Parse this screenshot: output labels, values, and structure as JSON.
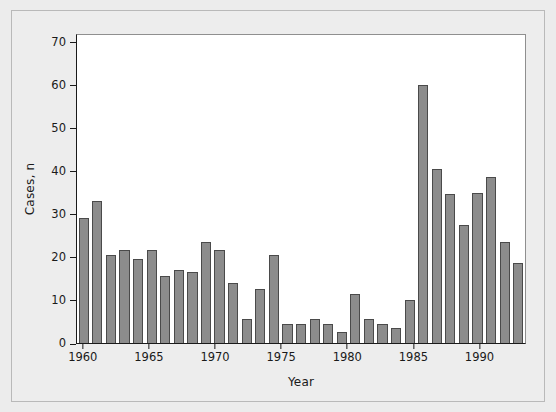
{
  "chart_data": {
    "type": "bar",
    "title": "",
    "xlabel": "Year",
    "ylabel": "Cases, n",
    "xlim": [
      1960,
      1993
    ],
    "ylim": [
      0,
      72
    ],
    "grid": false,
    "legend": null,
    "y_ticks": [
      0,
      10,
      20,
      30,
      40,
      50,
      60,
      70
    ],
    "x_ticks": [
      1960,
      1965,
      1970,
      1975,
      1980,
      1985,
      1990
    ],
    "categories": [
      1961,
      1962,
      1963,
      1964,
      1965,
      1966,
      1967,
      1968,
      1969,
      1970,
      1971,
      1972,
      1973,
      1974,
      1975,
      1976,
      1977,
      1978,
      1979,
      1980,
      1981,
      1982,
      1983,
      1984,
      1985,
      1986,
      1987,
      1988,
      1989,
      1990,
      1991,
      1992,
      1993
    ],
    "values": [
      29,
      33,
      20.5,
      21.5,
      19.5,
      21.5,
      15.5,
      17,
      16.5,
      23.5,
      21.5,
      14,
      5.5,
      12.5,
      20.5,
      4.5,
      4.5,
      5.5,
      4.5,
      2.5,
      11.5,
      5.5,
      4.5,
      3.5,
      10,
      60,
      40.5,
      34.5,
      27.5,
      34.8,
      38.5,
      23.5,
      18.5
    ],
    "bar_color": "#8c8c8c",
    "bar_edge_color": "#4a4a4a",
    "plot_background": "#ffffff",
    "figure_background": "#ededed",
    "axis_color": "#1a1a1a"
  }
}
